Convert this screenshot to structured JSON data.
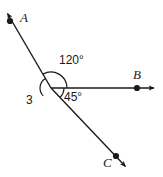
{
  "figure": {
    "background_color": "#ffffff",
    "stroke_color": "#1a1a1a",
    "vertex": {
      "x": 51,
      "y": 88
    },
    "points": [
      {
        "name": "A",
        "label": "A",
        "dot": {
          "x": 10,
          "y": 21
        },
        "arrow_tip": {
          "x": 4,
          "y": 9
        },
        "label_pos": {
          "x": 20,
          "y": 11
        }
      },
      {
        "name": "B",
        "label": "B",
        "dot": {
          "x": 137,
          "y": 88
        },
        "arrow_tip": {
          "x": 158,
          "y": 88
        },
        "label_pos": {
          "x": 133,
          "y": 68
        }
      },
      {
        "name": "C",
        "label": "C",
        "dot": {
          "x": 116,
          "y": 156
        },
        "arrow_tip": {
          "x": 129,
          "y": 170
        },
        "label_pos": {
          "x": 103,
          "y": 156
        }
      }
    ],
    "rays": [
      {
        "name": "ray-to-A",
        "from": "vertex",
        "to": "A",
        "direction_deg": 120
      },
      {
        "name": "ray-to-B",
        "from": "vertex",
        "to": "B",
        "direction_deg": 0
      },
      {
        "name": "ray-to-C",
        "from": "vertex",
        "to": "C",
        "direction_deg": -45
      }
    ],
    "angles": [
      {
        "name": "angle-120",
        "label": "120°",
        "value": 120,
        "unit": "degrees",
        "between": [
          "ray-to-B",
          "ray-to-A"
        ],
        "arc_radius": 16,
        "label_pos": {
          "x": 59,
          "y": 54
        }
      },
      {
        "name": "angle-45",
        "label": "45°",
        "value": 45,
        "unit": "degrees",
        "between": [
          "ray-to-B",
          "ray-to-C"
        ],
        "arc_radius": 13,
        "label_pos": {
          "x": 64,
          "y": 91
        }
      },
      {
        "name": "angle-3",
        "label": "3",
        "value": null,
        "unit": "unknown",
        "between": [
          "ray-to-A-opposite",
          "ray-to-C-opposite"
        ],
        "arc_radius": 11,
        "label_pos": {
          "x": 26,
          "y": 94
        }
      }
    ]
  }
}
